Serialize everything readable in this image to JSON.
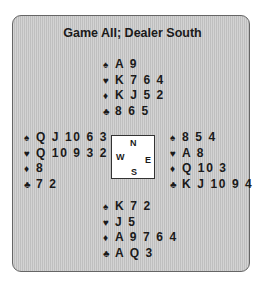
{
  "title": "Game All; Dealer South",
  "suit_symbols": {
    "spades": "♠",
    "hearts": "♥",
    "diamonds": "♦",
    "clubs": "♣"
  },
  "compass": {
    "north": "N",
    "south": "S",
    "east": "E",
    "west": "W"
  },
  "hands": {
    "north": {
      "spades": "A 9",
      "hearts": "K 7 6 4",
      "diamonds": "K J 5 2",
      "clubs": "8 6 5"
    },
    "west": {
      "spades": "Q J 10 6 3",
      "hearts": "Q 10 9 3 2",
      "diamonds": "8",
      "clubs": "7 2"
    },
    "east": {
      "spades": "8 5 4",
      "hearts": "A 8",
      "diamonds": "Q 10 3",
      "clubs": "K J 10 9 4"
    },
    "south": {
      "spades": "K 7 2",
      "hearts": "J 5",
      "diamonds": "A 9 7 6 4",
      "clubs": "A Q 3"
    }
  }
}
